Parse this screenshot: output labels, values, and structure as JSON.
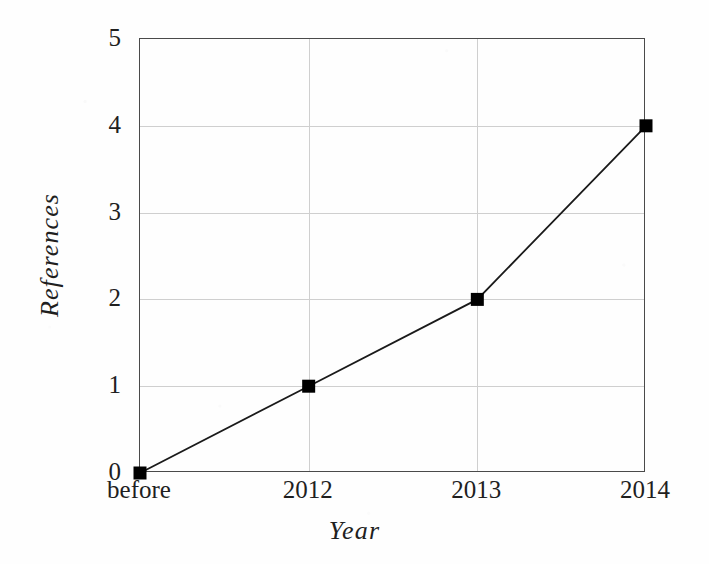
{
  "figure": {
    "background_color": "#fefefe",
    "axis_color": "#4a4a4a",
    "grid_color": "#cfcfcf",
    "series_color": "#1a1a1a",
    "marker_color": "#000000"
  },
  "chart_data": {
    "type": "line",
    "title": "",
    "subtitle": "",
    "xlabel": "Year",
    "ylabel": "References",
    "categories": [
      "before",
      "2012",
      "2013",
      "2014"
    ],
    "values": [
      0,
      1,
      2,
      4
    ],
    "series": [
      {
        "name": "References",
        "values": [
          0,
          1,
          2,
          4
        ],
        "marker": "square",
        "marker_color": "#000000",
        "line_color": "#1a1a1a"
      }
    ],
    "xtick_labels": [
      "before",
      "2012",
      "2013",
      "2014"
    ],
    "ytick_labels": [
      "0",
      "1",
      "2",
      "3",
      "4",
      "5"
    ],
    "ytick_values": [
      0,
      1,
      2,
      3,
      4,
      5
    ],
    "ylim": [
      0,
      5
    ],
    "grid": true,
    "grid_axes": "both",
    "legend": false,
    "legend_position": "none"
  }
}
